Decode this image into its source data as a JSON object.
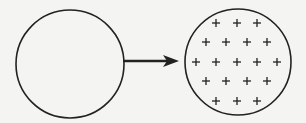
{
  "diagram": {
    "colors": {
      "stroke": "#222222",
      "background": "#f4f4f2"
    },
    "left_circle": {
      "cx": 70,
      "cy": 64,
      "r": 54,
      "content": "empty"
    },
    "arrow": {
      "x1": 123,
      "y1": 61,
      "x2": 179,
      "y2": 61,
      "direction": "right"
    },
    "right_circle": {
      "cx": 238,
      "cy": 62,
      "r": 53,
      "content": "plus-signs"
    },
    "plus_glyph": "+",
    "plus_rows": [
      {
        "y": 23,
        "xs": [
          216,
          237,
          257
        ]
      },
      {
        "y": 42,
        "xs": [
          206,
          226,
          247,
          267
        ]
      },
      {
        "y": 62,
        "xs": [
          196,
          216,
          237,
          257,
          277
        ]
      },
      {
        "y": 81,
        "xs": [
          206,
          226,
          247,
          267
        ]
      },
      {
        "y": 101,
        "xs": [
          216,
          237,
          257
        ]
      }
    ],
    "plus_count": 19
  }
}
